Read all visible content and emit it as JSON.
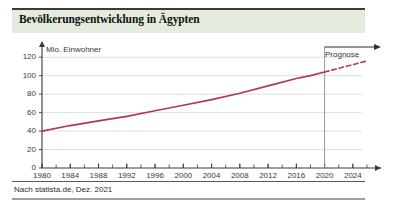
{
  "title": "Bevölkerungsentwicklung in Ägypten",
  "source": "Nach statista.de, Dez. 2021",
  "annotation": "Prognose",
  "colors": {
    "line": "#b03a4b",
    "title_band": "#e4ece0",
    "grid": "#d6d6d6",
    "axis": "#3a3a3a"
  },
  "chart_data": {
    "type": "line",
    "title": "Bevölkerungsentwicklung in Ägypten",
    "subtitle": "",
    "xlabel": "",
    "ylabel": "Mio. Einwohner",
    "xlim": [
      1980,
      2026
    ],
    "ylim": [
      0,
      130
    ],
    "grid": true,
    "legend": "none",
    "yticks": [
      0,
      20,
      40,
      60,
      80,
      100,
      120
    ],
    "ytick_labels": [
      "0",
      "20",
      "40",
      "60",
      "80",
      "100",
      "120"
    ],
    "xticks": [
      1980,
      1984,
      1988,
      1992,
      1996,
      2000,
      2004,
      2008,
      2012,
      2016,
      2020,
      2024
    ],
    "xtick_labels": [
      "1980",
      "1984",
      "1988",
      "1992",
      "1996",
      "2000",
      "2004",
      "2008",
      "2012",
      "2016",
      "2020",
      "2024"
    ],
    "xminor_step": 2,
    "annotations": [
      {
        "text": "Prognose",
        "x": 2020,
        "note": "forecast region begins at 2020"
      }
    ],
    "series": [
      {
        "name": "Bevölkerung (Ist)",
        "style": "solid",
        "color": "#b03a4b",
        "x": [
          1980,
          1984,
          1988,
          1992,
          1996,
          2000,
          2004,
          2008,
          2012,
          2016,
          2018,
          2020
        ],
        "values": [
          40,
          46,
          51,
          56,
          62,
          68,
          74,
          81,
          89,
          97,
          100,
          104
        ]
      },
      {
        "name": "Bevölkerung (Prognose)",
        "style": "dashed",
        "color": "#b03a4b",
        "x": [
          2020,
          2022,
          2024,
          2026
        ],
        "values": [
          104,
          108,
          112,
          116
        ]
      }
    ]
  }
}
